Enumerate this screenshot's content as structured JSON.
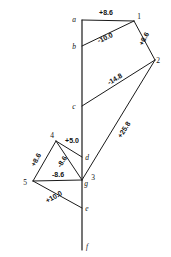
{
  "diagram": {
    "type": "force-polygon",
    "background_color": "#ffffff",
    "line_color": "#1a1a1a",
    "load_line": {
      "name": "vertical-load-line",
      "x": 82,
      "y_top": 20,
      "y_bottom": 250
    },
    "nodes": [
      {
        "id": "a",
        "label": "a",
        "x": 82,
        "y": 20,
        "label_x": 74,
        "label_y": 22,
        "kind": "load-point"
      },
      {
        "id": "b",
        "label": "b",
        "x": 82,
        "y": 46,
        "label_x": 74,
        "label_y": 49,
        "kind": "load-point"
      },
      {
        "id": "c",
        "label": "c",
        "x": 82,
        "y": 106,
        "label_x": 74,
        "label_y": 109,
        "kind": "load-point"
      },
      {
        "id": "d",
        "label": "d",
        "x": 82,
        "y": 157,
        "label_x": 87,
        "label_y": 160,
        "kind": "load-point"
      },
      {
        "id": "g",
        "label": "g",
        "x": 82,
        "y": 180,
        "label_x": 86,
        "label_y": 186,
        "kind": "load-point"
      },
      {
        "id": "e",
        "label": "e",
        "x": 82,
        "y": 208,
        "label_x": 87,
        "label_y": 211,
        "kind": "load-point"
      },
      {
        "id": "f",
        "label": "f",
        "x": 82,
        "y": 247,
        "label_x": 87,
        "label_y": 249,
        "kind": "load-point"
      },
      {
        "id": "1",
        "label": "1",
        "x": 134,
        "y": 21,
        "label_x": 139,
        "label_y": 19,
        "kind": "joint"
      },
      {
        "id": "2",
        "label": "2",
        "x": 155,
        "y": 60,
        "label_x": 158,
        "label_y": 63,
        "kind": "joint"
      },
      {
        "id": "3",
        "label": "3",
        "x": 82,
        "y": 180,
        "label_x": 93,
        "label_y": 180,
        "kind": "joint"
      },
      {
        "id": "4",
        "label": "4",
        "x": 56,
        "y": 141,
        "label_x": 52,
        "label_y": 138,
        "kind": "joint"
      },
      {
        "id": "5",
        "label": "5",
        "x": 33,
        "y": 181,
        "label_x": 25,
        "label_y": 185,
        "kind": "joint"
      }
    ],
    "members": [
      {
        "name": "member-a-1",
        "from": "a",
        "to": "1",
        "x1": 82,
        "y1": 20,
        "x2": 134,
        "y2": 21
      },
      {
        "name": "member-1-2",
        "from": "1",
        "to": "2",
        "x1": 134,
        "y1": 21,
        "x2": 155,
        "y2": 60
      },
      {
        "name": "member-b-1",
        "from": "b",
        "to": "1",
        "x1": 82,
        "y1": 46,
        "x2": 134,
        "y2": 21
      },
      {
        "name": "member-c-2",
        "from": "c",
        "to": "2",
        "x1": 82,
        "y1": 106,
        "x2": 155,
        "y2": 60
      },
      {
        "name": "member-2-g",
        "from": "2",
        "to": "g",
        "x1": 155,
        "y1": 60,
        "x2": 82,
        "y2": 180
      },
      {
        "name": "member-4-d",
        "from": "4",
        "to": "d",
        "x1": 56,
        "y1": 141,
        "x2": 82,
        "y2": 157
      },
      {
        "name": "member-4-5",
        "from": "4",
        "to": "5",
        "x1": 56,
        "y1": 141,
        "x2": 33,
        "y2": 181
      },
      {
        "name": "member-4-g",
        "from": "4",
        "to": "g",
        "x1": 56,
        "y1": 141,
        "x2": 82,
        "y2": 180
      },
      {
        "name": "member-5-g",
        "from": "5",
        "to": "g",
        "x1": 33,
        "y1": 181,
        "x2": 82,
        "y2": 180
      },
      {
        "name": "member-5-e",
        "from": "5",
        "to": "e",
        "x1": 33,
        "y1": 181,
        "x2": 82,
        "y2": 208
      }
    ],
    "force_labels": [
      {
        "name": "force-a-1",
        "value": "+8.6",
        "x": 106,
        "y": 15,
        "rotation": 0
      },
      {
        "name": "force-1-2",
        "value": "+8.6",
        "x": 146,
        "y": 40,
        "rotation": -62
      },
      {
        "name": "force-b-1",
        "value": "-10.0",
        "x": 106,
        "y": 40,
        "rotation": -25
      },
      {
        "name": "force-c-2",
        "value": "-14.8",
        "x": 116,
        "y": 81,
        "rotation": -31
      },
      {
        "name": "force-2-g",
        "value": "+25.8",
        "x": 126,
        "y": 131,
        "rotation": -58
      },
      {
        "name": "force-4-d",
        "value": "+5.0",
        "x": 72,
        "y": 143,
        "rotation": 0
      },
      {
        "name": "force-4-5",
        "value": "+8.6",
        "x": 38,
        "y": 161,
        "rotation": -61
      },
      {
        "name": "force-4-g",
        "value": "-8.6",
        "x": 64,
        "y": 163,
        "rotation": -57
      },
      {
        "name": "force-5-g",
        "value": "-8.6",
        "x": 58,
        "y": 177,
        "rotation": 0
      },
      {
        "name": "force-5-e",
        "value": "+10.0",
        "x": 55,
        "y": 199,
        "rotation": -29
      }
    ]
  }
}
